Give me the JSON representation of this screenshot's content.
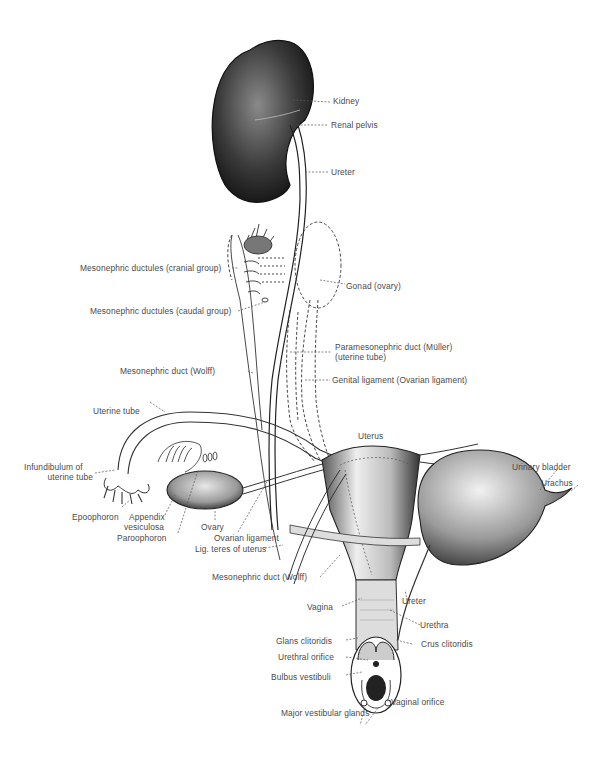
{
  "figure": {
    "labels": {
      "kidney": "Kidney",
      "renal_pelvis": "Renal pelvis",
      "ureter_upper": "Ureter",
      "mesonephric_ductules_cranial": "Mesonephric ductules (cranial group)",
      "mesonephric_ductules_caudal": "Mesonephric ductules (caudal group)",
      "gonad_ovary": "Gonad (ovary)",
      "paramesonephric_duct_line1": "Paramesonephric duct (Müller)",
      "paramesonephric_duct_line2": "(uterine tube)",
      "mesonephric_duct_upper": "Mesonephric duct (Wolff)",
      "genital_ligament": "Genital ligament (Ovarian ligament)",
      "uterine_tube": "Uterine tube",
      "uterus": "Uterus",
      "infundibulum_line1": "Infundibulum of",
      "infundibulum_line2": "uterine tube",
      "urinary_bladder": "Urinary bladder",
      "urachus": "Urachus",
      "epoophoron": "Epoophoron",
      "appendix_vesiculosa_line1": "Appendix",
      "appendix_vesiculosa_line2": "vesiculosa",
      "paroophoron": "Paroophoron",
      "ovary": "Ovary",
      "ovarian_ligament": "Ovarian ligament",
      "lig_teres_uteri": "Lig. teres of uterus",
      "mesonephric_duct_lower": "Mesonephric duct (Wolff)",
      "vagina": "Vagina",
      "ureter_lower": "Ureter",
      "urethra": "Urethra",
      "glans_clitoridis": "Glans clitoridis",
      "crus_clitoridis": "Crus clitoridis",
      "urethral_orifice": "Urethral orifice",
      "bulbus_vestibuli": "Bulbus vestibuli",
      "vaginal_orifice": "Vaginal orifice",
      "major_vestibular_glands": "Major vestibular glands"
    }
  }
}
